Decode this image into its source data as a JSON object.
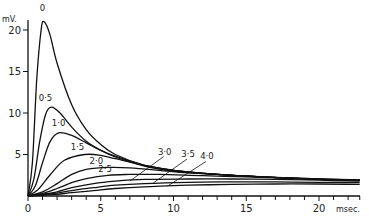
{
  "chart_data": {
    "type": "line",
    "title": "",
    "xlabel": "msec.",
    "ylabel": "mV.",
    "xlim": [
      0,
      23
    ],
    "ylim": [
      0,
      22
    ],
    "grid": false,
    "legend": "inline curve labels",
    "x_ticks": [
      0,
      5,
      10,
      15,
      20
    ],
    "x_tick_labels": [
      "0",
      "5",
      "10",
      "15",
      "20"
    ],
    "y_ticks": [
      5,
      10,
      15,
      20
    ],
    "y_tick_labels": [
      "5",
      "10",
      "15",
      "20"
    ],
    "series": [
      {
        "name": "0",
        "label": "0",
        "points": [
          [
            0,
            0
          ],
          [
            0.3,
            4
          ],
          [
            0.6,
            14
          ],
          [
            0.9,
            20
          ],
          [
            1.1,
            21
          ],
          [
            1.5,
            19.5
          ],
          [
            2,
            16
          ],
          [
            3,
            11
          ],
          [
            4,
            8
          ],
          [
            5,
            6.2
          ],
          [
            6,
            5
          ],
          [
            8,
            3.7
          ],
          [
            10,
            3.1
          ],
          [
            13,
            2.6
          ],
          [
            16,
            2.3
          ],
          [
            20,
            2.0
          ],
          [
            22.8,
            1.9
          ]
        ]
      },
      {
        "name": "0.5",
        "label": "0·5",
        "points": [
          [
            0,
            0
          ],
          [
            0.4,
            2
          ],
          [
            0.8,
            6.5
          ],
          [
            1.2,
            9.8
          ],
          [
            1.6,
            10.7
          ],
          [
            2.2,
            10
          ],
          [
            3,
            8.3
          ],
          [
            4,
            6.6
          ],
          [
            5,
            5.5
          ],
          [
            6,
            4.7
          ],
          [
            8,
            3.6
          ],
          [
            10,
            3.0
          ],
          [
            13,
            2.6
          ],
          [
            16,
            2.3
          ],
          [
            20,
            2.0
          ],
          [
            22.8,
            1.9
          ]
        ]
      },
      {
        "name": "1.0",
        "label": "1·0",
        "points": [
          [
            0,
            0
          ],
          [
            0.5,
            1.2
          ],
          [
            1,
            4
          ],
          [
            1.5,
            6.5
          ],
          [
            2.1,
            7.6
          ],
          [
            3,
            7.3
          ],
          [
            4,
            6.4
          ],
          [
            5,
            5.5
          ],
          [
            6,
            4.8
          ],
          [
            8,
            3.7
          ],
          [
            10,
            3.1
          ],
          [
            13,
            2.6
          ],
          [
            16,
            2.3
          ],
          [
            20,
            2.0
          ],
          [
            22.8,
            1.9
          ]
        ]
      },
      {
        "name": "1.5",
        "label": "1·5",
        "points": [
          [
            0,
            0
          ],
          [
            0.7,
            0.8
          ],
          [
            1.5,
            2.5
          ],
          [
            2.5,
            4.3
          ],
          [
            3.9,
            5.0
          ],
          [
            5,
            4.9
          ],
          [
            6,
            4.5
          ],
          [
            8,
            3.7
          ],
          [
            10,
            3.1
          ],
          [
            13,
            2.6
          ],
          [
            16,
            2.3
          ],
          [
            20,
            2.0
          ],
          [
            22.8,
            1.9
          ]
        ]
      },
      {
        "name": "2.0",
        "label": "2·0",
        "points": [
          [
            0,
            0
          ],
          [
            1,
            0.5
          ],
          [
            2,
            1.5
          ],
          [
            3,
            2.6
          ],
          [
            4,
            3.2
          ],
          [
            5.5,
            3.45
          ],
          [
            7,
            3.4
          ],
          [
            9,
            3.1
          ],
          [
            11,
            2.8
          ],
          [
            14,
            2.5
          ],
          [
            17,
            2.25
          ],
          [
            20,
            2.05
          ],
          [
            22.8,
            1.9
          ]
        ]
      },
      {
        "name": "2.5",
        "label": "2·5",
        "points": [
          [
            0,
            0
          ],
          [
            1,
            0.3
          ],
          [
            2,
            0.9
          ],
          [
            3,
            1.6
          ],
          [
            4,
            2.1
          ],
          [
            5.5,
            2.5
          ],
          [
            7,
            2.6
          ],
          [
            9,
            2.6
          ],
          [
            12,
            2.45
          ],
          [
            15,
            2.3
          ],
          [
            18,
            2.15
          ],
          [
            22.8,
            1.95
          ]
        ]
      },
      {
        "name": "3.0",
        "label": "3·0",
        "points": [
          [
            0,
            0
          ],
          [
            1,
            0.2
          ],
          [
            2,
            0.5
          ],
          [
            3,
            1.0
          ],
          [
            4.5,
            1.5
          ],
          [
            6,
            1.8
          ],
          [
            8,
            2.0
          ],
          [
            11,
            2.05
          ],
          [
            14,
            2.05
          ],
          [
            17,
            2.0
          ],
          [
            20,
            1.9
          ],
          [
            22.8,
            1.8
          ]
        ]
      },
      {
        "name": "3.5",
        "label": "3·5",
        "points": [
          [
            0,
            0
          ],
          [
            1,
            0.15
          ],
          [
            2,
            0.35
          ],
          [
            3,
            0.65
          ],
          [
            4.5,
            1.0
          ],
          [
            6,
            1.3
          ],
          [
            8,
            1.5
          ],
          [
            11,
            1.65
          ],
          [
            14,
            1.7
          ],
          [
            17,
            1.7
          ],
          [
            20,
            1.65
          ],
          [
            22.8,
            1.6
          ]
        ]
      },
      {
        "name": "4.0",
        "label": "4·0",
        "points": [
          [
            0,
            0
          ],
          [
            1,
            0.1
          ],
          [
            2,
            0.2
          ],
          [
            3,
            0.4
          ],
          [
            4.5,
            0.65
          ],
          [
            6,
            0.9
          ],
          [
            8,
            1.1
          ],
          [
            11,
            1.3
          ],
          [
            14,
            1.4
          ],
          [
            17,
            1.45
          ],
          [
            20,
            1.45
          ],
          [
            22.8,
            1.4
          ]
        ]
      }
    ],
    "annotations": [
      {
        "text": "0",
        "x": 1.0,
        "y": 22.3
      },
      {
        "text": "0·5",
        "x": 1.2,
        "y": 11.5
      },
      {
        "text": "1·0",
        "x": 2.1,
        "y": 8.4
      },
      {
        "text": "1·5",
        "x": 3.4,
        "y": 5.6
      },
      {
        "text": "2·0",
        "x": 4.7,
        "y": 3.9
      },
      {
        "text": "2·5",
        "x": 5.3,
        "y": 2.9
      },
      {
        "text": "3·0",
        "x": 9.4,
        "y": 5.0,
        "pointer_to": [
          7.0,
          1.8
        ]
      },
      {
        "text": "3·5",
        "x": 11.0,
        "y": 4.7,
        "pointer_to": [
          8.6,
          1.55
        ]
      },
      {
        "text": "4·0",
        "x": 12.3,
        "y": 4.4,
        "pointer_to": [
          9.6,
          1.2
        ]
      }
    ]
  },
  "axes": {
    "y_unit": "mV.",
    "x_unit": "msec."
  }
}
